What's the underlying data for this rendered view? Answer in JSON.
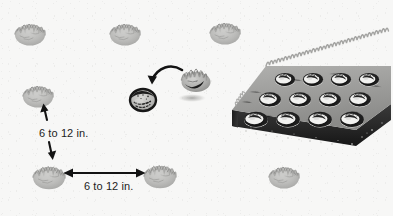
{
  "figure": {
    "background_color": "#f7f7f6",
    "ink_color": "#1d1d1d",
    "plant_color": "#b9b9b7"
  },
  "labels": {
    "vertical_spacing": "6 to 12 in.",
    "horizontal_spacing": "6 to 12 in."
  },
  "tray": {
    "name": "seedling flat",
    "columns": 4,
    "rows": 3,
    "cell_count": 12,
    "rim_color": "#2a2a2a",
    "soil_color": "#9e9e9c"
  },
  "plants": [
    {
      "id": "plant-top-left",
      "x": 30,
      "y": 33,
      "w": 30,
      "h": 23
    },
    {
      "id": "plant-top-center",
      "x": 125,
      "y": 33,
      "w": 30,
      "h": 23
    },
    {
      "id": "plant-top-right",
      "x": 225,
      "y": 32,
      "w": 30,
      "h": 23
    },
    {
      "id": "plant-mid-left",
      "x": 38,
      "y": 95,
      "w": 30,
      "h": 22
    },
    {
      "id": "plant-bottom-left",
      "x": 49,
      "y": 176,
      "w": 32,
      "h": 24
    },
    {
      "id": "plant-bottom-mid",
      "x": 160,
      "y": 175,
      "w": 32,
      "h": 24
    },
    {
      "id": "plant-bottom-right",
      "x": 284,
      "y": 176,
      "w": 30,
      "h": 23
    }
  ],
  "transplant": {
    "held_seedling": {
      "x": 196,
      "y": 76,
      "w": 30,
      "h": 25
    },
    "shadow": {
      "x": 192,
      "y": 98,
      "w": 26,
      "h": 7
    },
    "planting_hole": {
      "x": 143,
      "y": 97,
      "w": 26,
      "h": 22
    },
    "arrow": "curved arrow from held seedling to planting hole"
  },
  "arrows": {
    "vertical": {
      "x": 47,
      "y_top": 104,
      "y_bottom": 162,
      "heads": "both"
    },
    "horizontal": {
      "y": 173,
      "x_left": 66,
      "x_right": 143,
      "heads": "both"
    }
  }
}
